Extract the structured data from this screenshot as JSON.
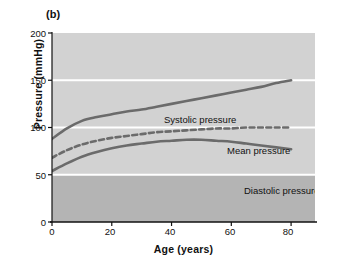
{
  "figure": {
    "panel_letter": "(b)"
  },
  "chart_data": {
    "type": "line",
    "title": "",
    "xlabel": "Age (years)",
    "ylabel": "Pressure (mmHg)",
    "xlim": [
      0,
      88
    ],
    "ylim": [
      0,
      200
    ],
    "xticks": [
      0,
      20,
      40,
      60,
      80
    ],
    "xtick_labels": [
      "0",
      "20",
      "40",
      "60",
      "80"
    ],
    "yticks": [
      0,
      50,
      100,
      150,
      200
    ],
    "ytick_labels": [
      "0",
      "50",
      "100",
      "150",
      "200"
    ],
    "grid": true,
    "gridlines_y": [
      50,
      100,
      150
    ],
    "grid_color": "#ffffff",
    "legend": "inline-annotations",
    "background_upper_color": "#d2d2d2",
    "background_lower_color": "#b4b4b4",
    "background_split_y": 50,
    "series": [
      {
        "name": "Systolic pressure",
        "label": "Systolic pressure",
        "style": "solid",
        "color": "#6b6b6b",
        "x": [
          0,
          5,
          10,
          15,
          20,
          25,
          30,
          35,
          40,
          45,
          50,
          55,
          60,
          65,
          70,
          75,
          80
        ],
        "values": [
          88,
          99,
          107,
          111,
          114,
          117,
          119,
          122,
          125,
          128,
          131,
          134,
          137,
          140,
          143,
          147,
          150
        ]
      },
      {
        "name": "Mean pressure",
        "label": "Mean pressure",
        "style": "dashed",
        "color": "#6b6b6b",
        "x": [
          0,
          5,
          10,
          15,
          20,
          25,
          30,
          35,
          40,
          45,
          50,
          55,
          60,
          65,
          70,
          75,
          80
        ],
        "values": [
          68,
          76,
          82,
          86,
          89,
          91,
          93,
          95,
          96,
          97,
          98,
          99,
          99,
          100,
          100,
          100,
          100
        ]
      },
      {
        "name": "Diastolic pressure",
        "label": "Diastolic pressure",
        "style": "solid",
        "color": "#6b6b6b",
        "x": [
          0,
          5,
          10,
          15,
          20,
          25,
          30,
          35,
          40,
          45,
          50,
          55,
          60,
          65,
          70,
          75,
          80
        ],
        "values": [
          54,
          62,
          69,
          74,
          78,
          81,
          83,
          85,
          86,
          87,
          87,
          86,
          85,
          83,
          81,
          79,
          77
        ]
      }
    ]
  }
}
